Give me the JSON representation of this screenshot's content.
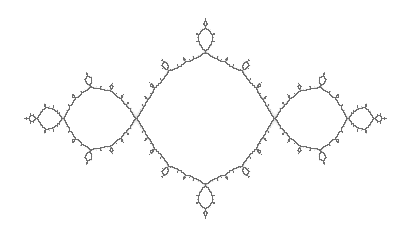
{
  "image": {
    "subject": "Julia set fractal (basilica) boundary",
    "background_color": "#ffffff",
    "stroke_color": "#6e6e6e",
    "width": 402,
    "height": 232
  },
  "fractal": {
    "type": "julia",
    "c_re": -1.0,
    "c_im": 0.0,
    "center_x_px": 205,
    "center_y_px": 118,
    "scale_px_per_unit": 112,
    "y_scale_px_per_unit": 128,
    "max_iter": 120
  }
}
